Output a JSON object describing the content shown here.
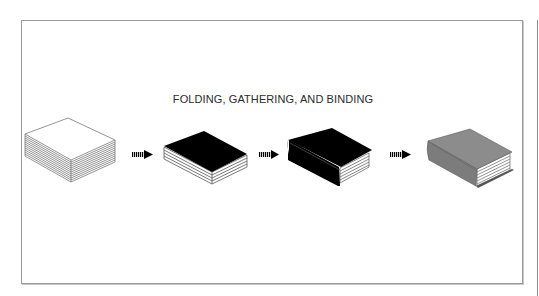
{
  "figure": {
    "title": "FOLDING, GATHERING, AND BINDING",
    "steps": [
      {
        "id": "folded-signatures",
        "description": "Stack of loose folded pages",
        "fill": "#ffffff"
      },
      {
        "id": "gathered-block",
        "description": "Gathered text block with black top",
        "fill": "#000000"
      },
      {
        "id": "bound-black-cover",
        "description": "Book block with black cover and spine",
        "fill": "#000000"
      },
      {
        "id": "bound-gray-cover",
        "description": "Finished bound book with gray cover",
        "fill": "#8a8a8a"
      }
    ],
    "arrows": [
      {
        "id": "arrow-1",
        "icon": "striped-right-arrow"
      },
      {
        "id": "arrow-2",
        "icon": "striped-right-arrow"
      },
      {
        "id": "arrow-3",
        "icon": "striped-right-arrow"
      }
    ],
    "colors": {
      "frame_border": "#9a9a9a",
      "title_text": "#2b2b2b",
      "black_cover": "#000000",
      "gray_cover": "#8a8a8a",
      "page_lines": "#7a7a7a"
    }
  }
}
